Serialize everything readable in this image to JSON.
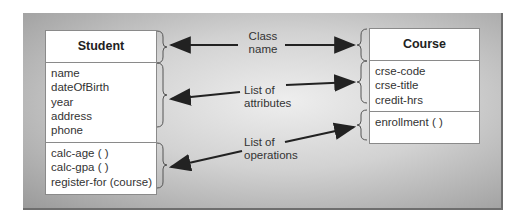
{
  "diagram": {
    "classes": [
      {
        "id": "student",
        "name": "Student",
        "attributes": [
          "name",
          "dateOfBirth",
          "year",
          "address",
          "phone"
        ],
        "operations": [
          "calc-age ( )",
          "calc-gpa ( )",
          "register-for (course)"
        ]
      },
      {
        "id": "course",
        "name": "Course",
        "attributes": [
          "crse-code",
          "crse-title",
          "credit-hrs"
        ],
        "operations": [
          "enrollment ( )"
        ]
      }
    ],
    "annotations": [
      {
        "line1": "Class",
        "line2": "name"
      },
      {
        "line1": "List of",
        "line2": "attributes"
      },
      {
        "line1": "List of",
        "line2": "operations"
      }
    ]
  }
}
